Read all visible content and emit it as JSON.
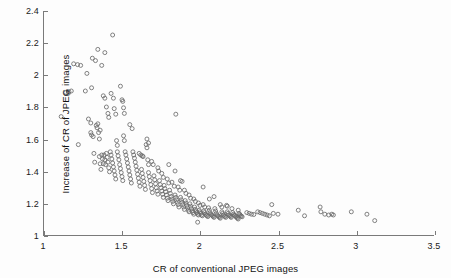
{
  "chart_data": {
    "type": "scatter",
    "title": "",
    "xlabel": "CR of conventional JPEG images",
    "ylabel": "Increase of CR of JPEG images",
    "xlim": [
      1,
      3.5
    ],
    "ylim": [
      1,
      2.4
    ],
    "xticks": [
      "1",
      "1.5",
      "2",
      "2.5",
      "3",
      "3.5"
    ],
    "xtick_values": [
      1,
      1.5,
      2,
      2.5,
      3,
      3.5
    ],
    "yticks": [
      "1",
      "1.2",
      "1.4",
      "1.6",
      "1.8",
      "2",
      "2.2",
      "2.4"
    ],
    "ytick_values": [
      1,
      1.2,
      1.4,
      1.6,
      1.8,
      2,
      2.2,
      2.4
    ],
    "grid": false,
    "legend": null,
    "marker": "open-circle",
    "marker_color": "#6b6b6b",
    "marker_size": 4,
    "axis_color": "#7a7a7a",
    "background": "#fdfdfd",
    "series": [
      {
        "name": "JPEG images",
        "points": [
          [
            1.11,
            1.74
          ],
          [
            1.14,
            1.89
          ],
          [
            1.155,
            1.885
          ],
          [
            1.16,
            1.895
          ],
          [
            1.175,
            1.9
          ],
          [
            1.19,
            2.07
          ],
          [
            1.215,
            2.065
          ],
          [
            1.235,
            2.06
          ],
          [
            1.22,
            1.565
          ],
          [
            1.265,
            1.9
          ],
          [
            1.275,
            2.01
          ],
          [
            1.285,
            1.725
          ],
          [
            1.3,
            1.7
          ],
          [
            1.305,
            1.92
          ],
          [
            1.31,
            2.105
          ],
          [
            1.33,
            2.09
          ],
          [
            1.3,
            1.64
          ],
          [
            1.305,
            1.625
          ],
          [
            1.315,
            1.615
          ],
          [
            1.32,
            1.51
          ],
          [
            1.325,
            1.455
          ],
          [
            1.335,
            1.685
          ],
          [
            1.34,
            1.67
          ],
          [
            1.345,
            1.695
          ],
          [
            1.35,
            1.64
          ],
          [
            1.355,
            1.6
          ],
          [
            1.36,
            1.655
          ],
          [
            1.345,
            2.16
          ],
          [
            1.37,
            2.06
          ],
          [
            1.39,
            2.14
          ],
          [
            1.355,
            1.49
          ],
          [
            1.36,
            1.445
          ],
          [
            1.365,
            1.41
          ],
          [
            1.37,
            1.5
          ],
          [
            1.375,
            1.475
          ],
          [
            1.38,
            1.445
          ],
          [
            1.385,
            1.5
          ],
          [
            1.39,
            1.47
          ],
          [
            1.395,
            1.44
          ],
          [
            1.4,
            1.51
          ],
          [
            1.405,
            1.485
          ],
          [
            1.41,
            1.455
          ],
          [
            1.415,
            1.42
          ],
          [
            1.42,
            1.395
          ],
          [
            1.38,
            1.87
          ],
          [
            1.39,
            1.855
          ],
          [
            1.4,
            1.8
          ],
          [
            1.41,
            1.76
          ],
          [
            1.415,
            1.735
          ],
          [
            1.425,
            1.52
          ],
          [
            1.43,
            1.5
          ],
          [
            1.435,
            1.475
          ],
          [
            1.44,
            1.45
          ],
          [
            1.445,
            1.425
          ],
          [
            1.45,
            1.4
          ],
          [
            1.455,
            1.375
          ],
          [
            1.46,
            1.35
          ],
          [
            1.44,
            2.25
          ],
          [
            1.43,
            1.885
          ],
          [
            1.445,
            1.855
          ],
          [
            1.45,
            1.79
          ],
          [
            1.46,
            1.755
          ],
          [
            1.465,
            1.59
          ],
          [
            1.47,
            1.56
          ],
          [
            1.47,
            1.52
          ],
          [
            1.475,
            1.495
          ],
          [
            1.48,
            1.47
          ],
          [
            1.485,
            1.44
          ],
          [
            1.49,
            1.415
          ],
          [
            1.495,
            1.39
          ],
          [
            1.5,
            1.365
          ],
          [
            1.505,
            1.34
          ],
          [
            1.49,
            1.93
          ],
          [
            1.5,
            1.845
          ],
          [
            1.505,
            1.835
          ],
          [
            1.51,
            1.795
          ],
          [
            1.515,
            1.76
          ],
          [
            1.51,
            1.62
          ],
          [
            1.515,
            1.59
          ],
          [
            1.52,
            1.52
          ],
          [
            1.525,
            1.5
          ],
          [
            1.53,
            1.475
          ],
          [
            1.535,
            1.45
          ],
          [
            1.54,
            1.425
          ],
          [
            1.545,
            1.4
          ],
          [
            1.55,
            1.375
          ],
          [
            1.555,
            1.35
          ],
          [
            1.56,
            1.325
          ],
          [
            1.55,
            1.69
          ],
          [
            1.565,
            1.665
          ],
          [
            1.57,
            1.52
          ],
          [
            1.575,
            1.5
          ],
          [
            1.58,
            1.48
          ],
          [
            1.585,
            1.455
          ],
          [
            1.59,
            1.43
          ],
          [
            1.595,
            1.405
          ],
          [
            1.6,
            1.38
          ],
          [
            1.605,
            1.355
          ],
          [
            1.61,
            1.33
          ],
          [
            1.615,
            1.305
          ],
          [
            1.61,
            1.51
          ],
          [
            1.62,
            1.5
          ],
          [
            1.63,
            1.495
          ],
          [
            1.635,
            1.49
          ],
          [
            1.625,
            1.41
          ],
          [
            1.63,
            1.385
          ],
          [
            1.635,
            1.36
          ],
          [
            1.64,
            1.335
          ],
          [
            1.645,
            1.31
          ],
          [
            1.65,
            1.285
          ],
          [
            1.655,
            1.565
          ],
          [
            1.66,
            1.545
          ],
          [
            1.66,
            1.6
          ],
          [
            1.67,
            1.575
          ],
          [
            1.665,
            1.47
          ],
          [
            1.67,
            1.44
          ],
          [
            1.67,
            1.39
          ],
          [
            1.675,
            1.365
          ],
          [
            1.68,
            1.34
          ],
          [
            1.685,
            1.315
          ],
          [
            1.69,
            1.29
          ],
          [
            1.695,
            1.265
          ],
          [
            1.69,
            1.46
          ],
          [
            1.7,
            1.44
          ],
          [
            1.705,
            1.37
          ],
          [
            1.71,
            1.345
          ],
          [
            1.715,
            1.32
          ],
          [
            1.72,
            1.295
          ],
          [
            1.725,
            1.275
          ],
          [
            1.73,
            1.255
          ],
          [
            1.73,
            1.42
          ],
          [
            1.735,
            1.4
          ],
          [
            1.74,
            1.34
          ],
          [
            1.745,
            1.315
          ],
          [
            1.75,
            1.295
          ],
          [
            1.755,
            1.275
          ],
          [
            1.76,
            1.255
          ],
          [
            1.765,
            1.235
          ],
          [
            1.755,
            1.385
          ],
          [
            1.765,
            1.36
          ],
          [
            1.77,
            1.31
          ],
          [
            1.775,
            1.29
          ],
          [
            1.78,
            1.27
          ],
          [
            1.785,
            1.25
          ],
          [
            1.79,
            1.23
          ],
          [
            1.795,
            1.215
          ],
          [
            1.79,
            1.35
          ],
          [
            1.8,
            1.325
          ],
          [
            1.8,
            1.44
          ],
          [
            1.805,
            1.28
          ],
          [
            1.81,
            1.26
          ],
          [
            1.815,
            1.24
          ],
          [
            1.82,
            1.225
          ],
          [
            1.825,
            1.21
          ],
          [
            1.83,
            1.195
          ],
          [
            1.82,
            1.33
          ],
          [
            1.835,
            1.305
          ],
          [
            1.84,
            1.4
          ],
          [
            1.845,
            1.755
          ],
          [
            1.84,
            1.25
          ],
          [
            1.845,
            1.235
          ],
          [
            1.85,
            1.22
          ],
          [
            1.855,
            1.205
          ],
          [
            1.86,
            1.19
          ],
          [
            1.865,
            1.175
          ],
          [
            1.86,
            1.3
          ],
          [
            1.87,
            1.28
          ],
          [
            1.875,
            1.34
          ],
          [
            1.885,
            1.335
          ],
          [
            1.875,
            1.235
          ],
          [
            1.88,
            1.22
          ],
          [
            1.885,
            1.205
          ],
          [
            1.89,
            1.19
          ],
          [
            1.895,
            1.175
          ],
          [
            1.9,
            1.16
          ],
          [
            1.9,
            1.28
          ],
          [
            1.91,
            1.26
          ],
          [
            1.905,
            1.215
          ],
          [
            1.91,
            1.2
          ],
          [
            1.915,
            1.185
          ],
          [
            1.92,
            1.17
          ],
          [
            1.925,
            1.155
          ],
          [
            1.93,
            1.145
          ],
          [
            1.93,
            1.25
          ],
          [
            1.94,
            1.23
          ],
          [
            1.935,
            1.195
          ],
          [
            1.94,
            1.18
          ],
          [
            1.945,
            1.165
          ],
          [
            1.95,
            1.15
          ],
          [
            1.955,
            1.14
          ],
          [
            1.96,
            1.13
          ],
          [
            1.96,
            1.225
          ],
          [
            1.97,
            1.21
          ],
          [
            1.965,
            1.175
          ],
          [
            1.97,
            1.16
          ],
          [
            1.975,
            1.15
          ],
          [
            1.98,
            1.14
          ],
          [
            1.985,
            1.13
          ],
          [
            1.99,
            1.125
          ],
          [
            1.99,
            1.2
          ],
          [
            2.0,
            1.185
          ],
          [
            1.995,
            1.155
          ],
          [
            2.0,
            1.145
          ],
          [
            2.005,
            1.135
          ],
          [
            2.01,
            1.125
          ],
          [
            2.015,
            1.12
          ],
          [
            1.985,
            1.08
          ],
          [
            2.02,
            1.3
          ],
          [
            2.02,
            1.19
          ],
          [
            2.03,
            1.175
          ],
          [
            2.025,
            1.15
          ],
          [
            2.03,
            1.14
          ],
          [
            2.035,
            1.13
          ],
          [
            2.04,
            1.125
          ],
          [
            2.045,
            1.12
          ],
          [
            2.05,
            1.115
          ],
          [
            2.06,
            1.225
          ],
          [
            2.055,
            1.17
          ],
          [
            2.06,
            1.155
          ],
          [
            2.065,
            1.14
          ],
          [
            2.07,
            1.13
          ],
          [
            2.075,
            1.125
          ],
          [
            2.08,
            1.12
          ],
          [
            2.085,
            1.115
          ],
          [
            2.09,
            1.11
          ],
          [
            2.09,
            1.24
          ],
          [
            2.095,
            1.165
          ],
          [
            2.1,
            1.15
          ],
          [
            2.105,
            1.135
          ],
          [
            2.11,
            1.125
          ],
          [
            2.115,
            1.12
          ],
          [
            2.12,
            1.115
          ],
          [
            2.125,
            1.11
          ],
          [
            2.13,
            1.105
          ],
          [
            2.13,
            1.19
          ],
          [
            2.14,
            1.175
          ],
          [
            2.14,
            1.145
          ],
          [
            2.145,
            1.135
          ],
          [
            2.15,
            1.125
          ],
          [
            2.155,
            1.12
          ],
          [
            2.16,
            1.115
          ],
          [
            2.165,
            1.11
          ],
          [
            2.17,
            1.185
          ],
          [
            2.175,
            1.18
          ],
          [
            2.175,
            1.145
          ],
          [
            2.18,
            1.135
          ],
          [
            2.185,
            1.125
          ],
          [
            2.19,
            1.12
          ],
          [
            2.195,
            1.115
          ],
          [
            2.2,
            1.11
          ],
          [
            2.205,
            1.165
          ],
          [
            2.21,
            1.14
          ],
          [
            2.215,
            1.13
          ],
          [
            2.22,
            1.125
          ],
          [
            2.225,
            1.12
          ],
          [
            2.23,
            1.115
          ],
          [
            2.235,
            1.11
          ],
          [
            2.24,
            1.105
          ],
          [
            2.245,
            1.1
          ],
          [
            2.245,
            1.155
          ],
          [
            2.25,
            1.135
          ],
          [
            2.255,
            1.128
          ],
          [
            2.26,
            1.122
          ],
          [
            2.265,
            1.118
          ],
          [
            2.27,
            1.114
          ],
          [
            2.3,
            1.14
          ],
          [
            2.315,
            1.135
          ],
          [
            2.33,
            1.13
          ],
          [
            2.345,
            1.128
          ],
          [
            2.37,
            1.145
          ],
          [
            2.385,
            1.14
          ],
          [
            2.4,
            1.135
          ],
          [
            2.415,
            1.13
          ],
          [
            2.43,
            1.125
          ],
          [
            2.445,
            1.12
          ],
          [
            2.46,
            1.19
          ],
          [
            2.47,
            1.135
          ],
          [
            2.5,
            1.13
          ],
          [
            2.63,
            1.155
          ],
          [
            2.67,
            1.12
          ],
          [
            2.77,
            1.175
          ],
          [
            2.775,
            1.145
          ],
          [
            2.8,
            1.13
          ],
          [
            2.825,
            1.125
          ],
          [
            2.845,
            1.13
          ],
          [
            2.855,
            1.125
          ],
          [
            2.97,
            1.145
          ],
          [
            3.07,
            1.13
          ],
          [
            3.12,
            1.09
          ]
        ]
      }
    ]
  }
}
